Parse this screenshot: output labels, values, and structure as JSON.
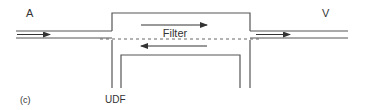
{
  "diagram": {
    "panel_label": "(c)",
    "inlet_label": "A",
    "outlet_label": "V",
    "filter_label": "Filter",
    "device_label": "UDF",
    "line_color": "#555555",
    "text_color": "#333333"
  }
}
